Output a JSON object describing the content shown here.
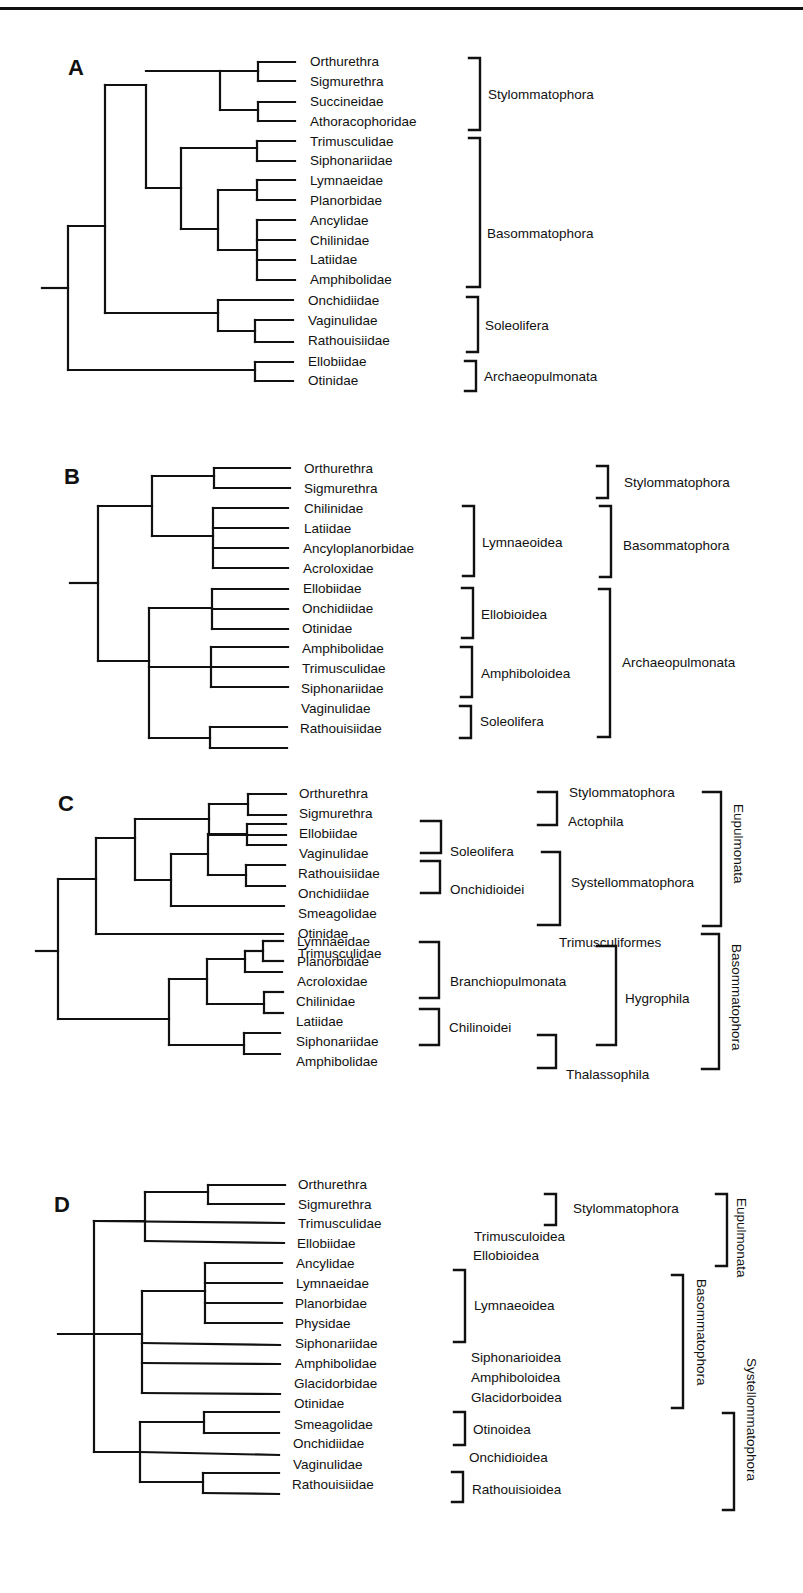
{
  "figure": {
    "panels": [
      {
        "letter": "A",
        "leaves": [
          "Orthurethra",
          "Sigmurethra",
          "Succineidae",
          "Athoracophoridae",
          "Trimusculidae",
          "Siphonariidae",
          "Lymnaeidae",
          "Planorbidae",
          "Ancylidae",
          "Chilinidae",
          "Latiidae",
          "Amphibolidae",
          "Onchidiidae",
          "Vaginulidae",
          "Rathouisiidae",
          "Ellobiidae",
          "Otinidae"
        ],
        "groups": [
          "Stylommatophora",
          "Basommatophora",
          "Soleolifera",
          "Archaeopulmonata"
        ]
      },
      {
        "letter": "B",
        "leaves": [
          "Orthurethra",
          "Sigmurethra",
          "Chilinidae",
          "Latiidae",
          "Ancyloplanorbidae",
          "Acroloxidae",
          "Ellobiidae",
          "Onchidiidae",
          "Otinidae",
          "Amphibolidae",
          "Trimusculidae",
          "Siphonariidae",
          "Vaginulidae",
          "Rathouisiidae"
        ],
        "inner_groups": [
          "Lymnaeoidea",
          "Ellobioidea",
          "Amphiboloidea",
          "Soleolifera"
        ],
        "outer_groups": [
          "Stylommatophora",
          "Basommatophora",
          "Archaeopulmonata"
        ]
      },
      {
        "letter": "C",
        "leaves": [
          "Orthurethra",
          "Sigmurethra",
          "Ellobiidae",
          "Vaginulidae",
          "Rathouisiidae",
          "Onchidiidae",
          "Smeagolidae",
          "Otinidae",
          "Trimusculidae",
          "Lymnaeidae",
          "Planorbidae",
          "Acroloxidae",
          "Chilinidae",
          "Latiidae",
          "Siphonariidae",
          "Amphibolidae"
        ],
        "inner_groups": [
          "Soleolifera",
          "Onchidioidei",
          "Branchiopulmonata",
          "Chilinoidei"
        ],
        "middle_groups": [
          "Stylommatophora",
          "Actophila",
          "Systellommatophora",
          "Trimusculiformes",
          "Hygrophila",
          "Thalassophila"
        ],
        "outer_groups": [
          "Eupulmonata",
          "Basommatophora"
        ]
      },
      {
        "letter": "D",
        "leaves": [
          "Orthurethra",
          "Sigmurethra",
          "Trimusculidae",
          "Ellobiidae",
          "Ancylidae",
          "Lymnaeidae",
          "Planorbidae",
          "Physidae",
          "Siphonariidae",
          "Amphibolidae",
          "Glacidorbidae",
          "Otinidae",
          "Smeagolidae",
          "Onchidiidae",
          "Vaginulidae",
          "Rathouisiidae"
        ],
        "inner_groups": [
          "Stylommatophora",
          "Trimusculoidea",
          "Ellobioidea",
          "Lymnaeoidea",
          "Siphonarioidea",
          "Amphiboloidea",
          "Glacidorboidea",
          "Otinoidea",
          "Onchidioidea",
          "Rathouisioidea"
        ],
        "outer_groups": [
          "Eupulmonata",
          "Basommatophora",
          "Systellommatophora"
        ]
      }
    ]
  }
}
